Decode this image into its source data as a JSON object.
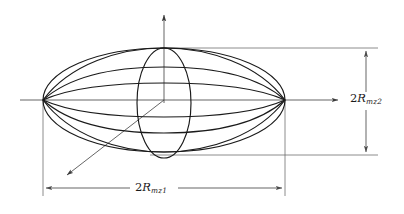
{
  "figure": {
    "background_color": "#ffffff",
    "line_color": "#1a1a1a",
    "guide_color": "#666666",
    "width": 404,
    "height": 214
  },
  "labels": {
    "horizontal_dimension": {
      "text": "2Rmz1",
      "prefix": "2",
      "variable": "R",
      "subscript": "mz1",
      "position": "bottom-center"
    },
    "vertical_dimension": {
      "text": "2Rmz2",
      "prefix": "2",
      "variable": "R",
      "subscript": "mz2",
      "position": "right-middle"
    }
  },
  "geometry": {
    "center": {
      "x": 164,
      "y": 100
    },
    "outer_ellipse": {
      "cx": 164,
      "cy": 100,
      "rx": 121,
      "ry": 52
    },
    "central_vertical_ellipse": {
      "cx": 164,
      "cy": 103,
      "rx": 27,
      "ry": 55
    },
    "left_pole": {
      "x": 43,
      "y": 100
    },
    "right_pole": {
      "x": 285,
      "y": 100
    },
    "latitude_offsets": [
      -52,
      -33,
      -17,
      0,
      17,
      33,
      52
    ],
    "axes": {
      "vertical_arrow_tip": {
        "x": 164,
        "y": 12
      },
      "horizontal_arrow_tip": {
        "x": 341,
        "y": 100
      },
      "diagonal_arrow_tip": {
        "x": 64,
        "y": 178
      }
    },
    "dimension_lines": {
      "horizontal": {
        "y": 188,
        "x_start": 43,
        "x_end": 285
      },
      "vertical": {
        "x": 366,
        "y_top": 48,
        "y_bottom": 155
      },
      "extension_top_y": 48,
      "extension_bottom_y": 155,
      "extension_right_x": 378
    }
  }
}
